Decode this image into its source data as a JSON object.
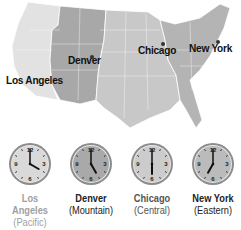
{
  "map": {
    "cities": [
      {
        "name": "Los Angeles",
        "x": 6,
        "y": 74
      },
      {
        "name": "Denver",
        "x": 68,
        "y": 54
      },
      {
        "name": "Chicago",
        "x": 138,
        "y": 44
      },
      {
        "name": "New York",
        "x": 189,
        "y": 42
      }
    ],
    "zone_colors": {
      "pacific": "#e2e2e2",
      "mountain": "#a8a8a8",
      "central": "#c8c8c8",
      "eastern": "#b4b4b4"
    }
  },
  "clocks": [
    {
      "city": "Los Angeles",
      "zone": "(Pacific)",
      "hour": 4,
      "minute": 0,
      "face": "#d9d9d9",
      "label_color": "#a0a0a0"
    },
    {
      "city": "Denver",
      "zone": "(Mountain)",
      "hour": 5,
      "minute": 0,
      "face": "#a9a9a9",
      "label_color": "#222222"
    },
    {
      "city": "Chicago",
      "zone": "(Central)",
      "hour": 6,
      "minute": 0,
      "face": "#cccccc",
      "label_color": "#555555"
    },
    {
      "city": "New York",
      "zone": "(Eastern)",
      "hour": 7,
      "minute": 0,
      "face": "#bbbbbb",
      "label_color": "#222222"
    }
  ]
}
